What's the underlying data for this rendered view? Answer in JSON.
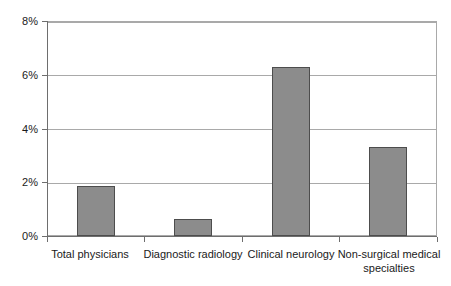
{
  "chart_data": {
    "type": "bar",
    "title": "",
    "subtitle": "",
    "xlabel": "",
    "ylabel": "",
    "categories": [
      "Total physicians",
      "Diagnostic radiology",
      "Clinical neurology",
      "Non-surgical medical specialties"
    ],
    "values": [
      1.85,
      0.65,
      6.3,
      3.3
    ],
    "value_unit": "%",
    "ylim": [
      0,
      8
    ],
    "ytick_values": [
      0,
      2,
      4,
      6,
      8
    ],
    "ytick_labels": [
      "0%",
      "2%",
      "4%",
      "6%",
      "8%"
    ],
    "grid": true,
    "legend": "none",
    "series": [
      {
        "name": "",
        "values": [
          1.85,
          0.65,
          6.3,
          3.3
        ]
      }
    ],
    "colors": {
      "bar_fill": "#8c8c8c",
      "bar_border": "#4d4d4d",
      "gridline": "#a9a9a9",
      "axis": "#6e6e6e",
      "text": "#1a1a1a",
      "background": "#ffffff"
    }
  },
  "axis": {
    "y_labels": [
      "8%",
      "6%",
      "4%",
      "2%",
      "0%"
    ]
  },
  "categories_display": [
    {
      "line1": "Total physicians",
      "line2": ""
    },
    {
      "line1": "Diagnostic radiology",
      "line2": ""
    },
    {
      "line1": "Clinical neurology",
      "line2": ""
    },
    {
      "line1": "Non-surgical medical",
      "line2": "specialties"
    }
  ]
}
